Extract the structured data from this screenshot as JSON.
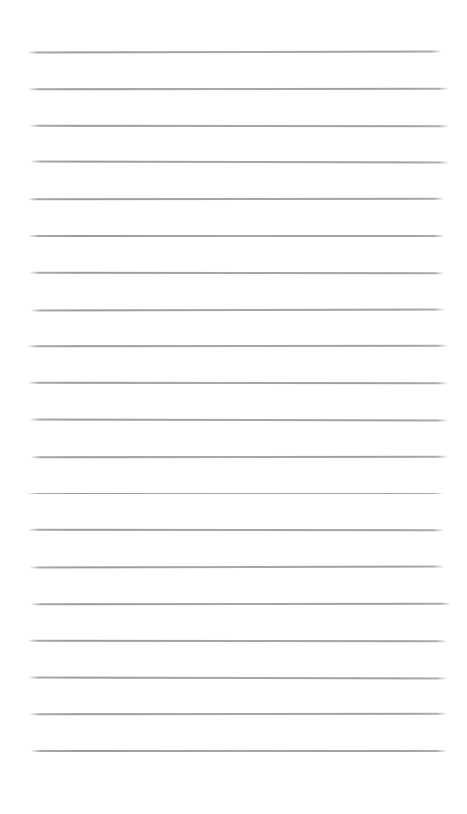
{
  "paper": {
    "background_color": "#ffffff",
    "ruled_lines": {
      "count": 20,
      "color": "#9e9e9e",
      "first_line_y": 51,
      "last_line_y": 750,
      "line_spacing": 36.8,
      "line_left_x": 28,
      "line_right_x": 446
    }
  }
}
